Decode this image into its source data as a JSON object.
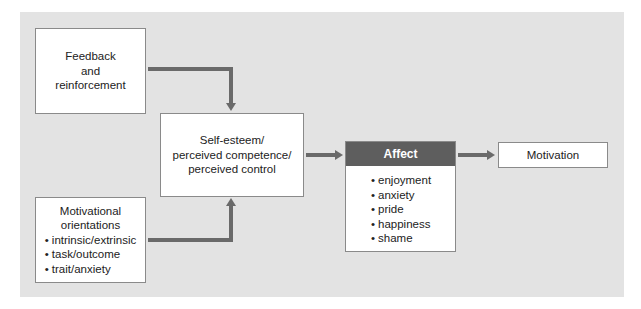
{
  "diagram": {
    "nodes": {
      "feedback": {
        "lines": [
          "Feedback",
          "and",
          "reinforcement"
        ]
      },
      "orientations": {
        "title_lines": [
          "Motivational",
          "orientations"
        ],
        "items": [
          "intrinsic/extrinsic",
          "task/outcome",
          "trait/anxiety"
        ]
      },
      "self_esteem": {
        "lines": [
          "Self-esteem/",
          "perceived competence/",
          "perceived control"
        ]
      },
      "affect": {
        "title": "Affect",
        "items": [
          "enjoyment",
          "anxiety",
          "pride",
          "happiness",
          "shame"
        ]
      },
      "motivation": {
        "label": "Motivation"
      }
    },
    "edges": [
      {
        "from": "feedback",
        "to": "self_esteem"
      },
      {
        "from": "orientations",
        "to": "self_esteem"
      },
      {
        "from": "self_esteem",
        "to": "affect"
      },
      {
        "from": "affect",
        "to": "motivation"
      }
    ],
    "colors": {
      "panel": "#e3e3e3",
      "arrow": "#6a6a6a",
      "affect_header": "#5e5e5e"
    }
  }
}
